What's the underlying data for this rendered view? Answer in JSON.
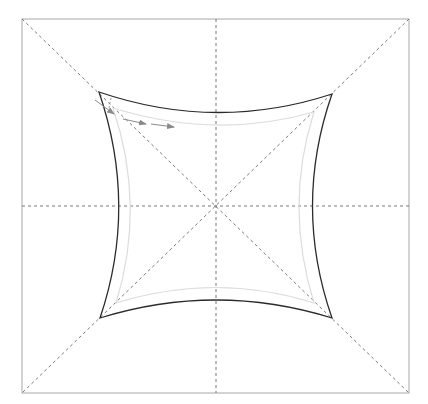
{
  "diagram": {
    "colors": {
      "frame": "#a8a8a8",
      "guides": "#6a6a6a",
      "outer_shape": "#2b2b2b",
      "inner_shape": "#dcdcdc",
      "arrows": "#8a8a8a",
      "background": "#ffffff"
    },
    "elements": {
      "frame": "square-frame",
      "guides": [
        "vertical-center-line",
        "horizontal-center-line",
        "diagonal-tl-br",
        "diagonal-tr-bl"
      ],
      "shapes": [
        "outer-concave-square",
        "inner-concave-square"
      ],
      "arrows_count": 3
    }
  }
}
